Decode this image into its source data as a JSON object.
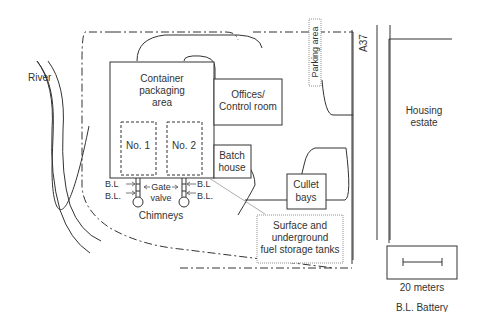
{
  "diagram": {
    "labels": {
      "container_area": [
        "Container",
        "packaging",
        "area"
      ],
      "furnace1": "No. 1",
      "furnace2": "No. 2",
      "offices": [
        "Offices/",
        "Control room"
      ],
      "batch_house": [
        "Batch",
        "house"
      ],
      "cullet_bays": [
        "Cullet",
        "bays"
      ],
      "parking": "Parking area",
      "road": "A37",
      "housing": [
        "Housing",
        "estate"
      ],
      "river": "River",
      "chimneys": "Chimneys",
      "gate_valve": [
        "Gate",
        "valve"
      ],
      "bl_left_1": "B.L",
      "bl_left_2": "B.L.",
      "bl_right_1": "B.L",
      "bl_right_2": "B.L.",
      "fuel_tanks": [
        "Surface and",
        "underground",
        "fuel storage tanks"
      ],
      "scale": "20 meters",
      "legend": "B.L. Battery"
    },
    "colors": {
      "line": "#333333",
      "text": "#333333",
      "leader": "#999999"
    }
  }
}
